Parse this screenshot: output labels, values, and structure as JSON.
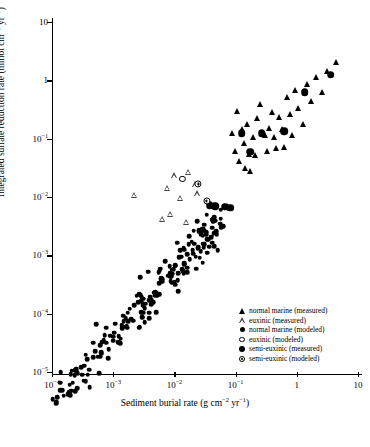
{
  "chart_data": {
    "type": "scatter",
    "title": "",
    "xlabel": "Sediment burial rate (g cm−2 yr−1)",
    "ylabel": "Integrated sulfate reduction rate (mmol cm−2 yr−1)",
    "xscale": "log",
    "yscale": "log",
    "xlim": [
      0.0001,
      10
    ],
    "ylim": [
      1e-05,
      10
    ],
    "grid": false,
    "legend_position": "lower-right",
    "xticks": [
      {
        "value": 0.0001,
        "label": "10−4",
        "mantissa": "10",
        "exponent": "−4"
      },
      {
        "value": 0.001,
        "label": "10−3",
        "mantissa": "10",
        "exponent": "−3"
      },
      {
        "value": 0.01,
        "label": "10−2",
        "mantissa": "10",
        "exponent": "−2"
      },
      {
        "value": 0.1,
        "label": "10−1",
        "mantissa": "10",
        "exponent": "−1"
      },
      {
        "value": 1,
        "label": "1",
        "mantissa": "1",
        "exponent": ""
      },
      {
        "value": 10,
        "label": "10",
        "mantissa": "10",
        "exponent": ""
      }
    ],
    "yticks": [
      {
        "value": 10,
        "label": "10",
        "mantissa": "10",
        "exponent": ""
      },
      {
        "value": 1,
        "label": "1",
        "mantissa": "1",
        "exponent": ""
      },
      {
        "value": 0.1,
        "label": "10−1",
        "mantissa": "10",
        "exponent": "−1"
      },
      {
        "value": 0.01,
        "label": "10−2",
        "mantissa": "10",
        "exponent": "−2"
      },
      {
        "value": 0.001,
        "label": "10−3",
        "mantissa": "10",
        "exponent": "−3"
      },
      {
        "value": 0.0001,
        "label": "10−4",
        "mantissa": "10",
        "exponent": "−4"
      },
      {
        "value": 1e-05,
        "label": "10−5",
        "mantissa": "10",
        "exponent": "−5"
      }
    ],
    "series": [
      {
        "name": "normal marine (measured)",
        "marker": "filled-triangle",
        "color": "#000000",
        "points": [
          [
            0.105,
            0.3
          ],
          [
            0.125,
            0.145
          ],
          [
            0.135,
            0.085
          ],
          [
            0.155,
            0.175
          ],
          [
            0.165,
            0.055
          ],
          [
            0.195,
            0.105
          ],
          [
            0.205,
            0.052
          ],
          [
            0.225,
            0.225
          ],
          [
            0.255,
            0.4
          ],
          [
            0.3,
            0.115
          ],
          [
            0.32,
            0.062
          ],
          [
            0.355,
            0.155
          ],
          [
            0.4,
            0.285
          ],
          [
            0.43,
            0.105
          ],
          [
            0.46,
            0.068
          ],
          [
            0.52,
            0.235
          ],
          [
            0.58,
            0.145
          ],
          [
            0.62,
            0.072
          ],
          [
            0.7,
            0.52
          ],
          [
            0.76,
            0.26
          ],
          [
            0.82,
            0.115
          ],
          [
            0.95,
            0.68
          ],
          [
            1.05,
            0.33
          ],
          [
            1.25,
            0.175
          ],
          [
            1.45,
            0.85
          ],
          [
            1.7,
            0.44
          ],
          [
            2.05,
            1.15
          ],
          [
            2.6,
            0.62
          ],
          [
            3.1,
            1.45
          ],
          [
            4.4,
            2.05
          ],
          [
            0.088,
            0.125
          ],
          [
            0.098,
            0.062
          ],
          [
            0.115,
            0.042
          ],
          [
            0.145,
            0.032
          ],
          [
            0.175,
            0.028
          ]
        ]
      },
      {
        "name": "euxinic (measured)",
        "marker": "open-triangle",
        "color": "#444444",
        "points": [
          [
            0.0022,
            0.011
          ],
          [
            0.0075,
            0.0145
          ],
          [
            0.0098,
            0.0235
          ],
          [
            0.0125,
            0.0098
          ],
          [
            0.0165,
            0.0265
          ],
          [
            0.0215,
            0.0165
          ],
          [
            0.0235,
            0.0115
          ],
          [
            0.0062,
            0.0042
          ],
          [
            0.0155,
            0.0038
          ],
          [
            0.0085,
            0.0052
          ]
        ]
      },
      {
        "name": "normal marine (modeled)",
        "marker": "filled-circle-small",
        "color": "#000000",
        "point_count": 205,
        "description": "dense positively-correlated cloud spanning x 1e-4 to 6e-2, y 3e-6 to 8e-3"
      },
      {
        "name": "euxinic (modeled)",
        "marker": "open-circle",
        "color": "#000000",
        "points": [
          [
            0.0135,
            0.0205
          ]
        ]
      },
      {
        "name": "semi-euxinic (measured)",
        "marker": "filled-circle-large",
        "color": "#000000",
        "points": [
          [
            0.038,
            0.0072
          ],
          [
            0.046,
            0.007
          ],
          [
            0.068,
            0.0068
          ],
          [
            0.082,
            0.0066
          ],
          [
            0.125,
            0.125
          ],
          [
            0.175,
            0.06
          ],
          [
            0.265,
            0.125
          ],
          [
            0.62,
            0.135
          ],
          [
            1.35,
            0.62
          ],
          [
            3.6,
            1.25
          ]
        ]
      },
      {
        "name": "semi-euxinic (modeled)",
        "marker": "dot-circle",
        "color": "#000000",
        "points": [
          [
            0.0245,
            0.0168
          ],
          [
            0.0335,
            0.0086
          ]
        ]
      }
    ]
  },
  "axes": {
    "ylabel_prefix": "Integrated sulfate reduction rate (mmol cm",
    "ylabel_sup1": "−2",
    "ylabel_mid": " yr",
    "ylabel_sup2": "−1",
    "ylabel_suffix": ")",
    "xlabel_prefix": "Sediment burial rate (g cm",
    "xlabel_sup1": "−2",
    "xlabel_mid": " yr",
    "xlabel_sup2": "−1",
    "xlabel_suffix": ")"
  },
  "legend": {
    "items": [
      {
        "label": "normal marine (measured)",
        "marker": "filled-triangle"
      },
      {
        "label": "euxinic (measured)",
        "marker": "open-triangle"
      },
      {
        "label": "normal marine (modeled)",
        "marker": "filled-circle-small"
      },
      {
        "label": "euxinic (modeled)",
        "marker": "open-circle"
      },
      {
        "label": "semi-euxinic (measured)",
        "marker": "filled-circle-large"
      },
      {
        "label": "semi-euxinic (modeled)",
        "marker": "dot-circle"
      }
    ]
  }
}
